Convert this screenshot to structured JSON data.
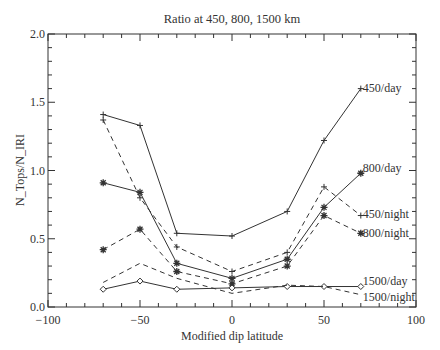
{
  "chart_data": {
    "type": "line",
    "title": "Ratio at 450, 800, 1500 km",
    "xlabel": "Modified dip latitude",
    "ylabel": "N_Tops/N_IRI",
    "xlim": [
      -100,
      100
    ],
    "ylim": [
      0.0,
      2.0
    ],
    "x_ticks": [
      -100,
      -50,
      0,
      50,
      100
    ],
    "x_tick_labels": [
      "−100",
      "−50",
      "0",
      "50",
      "100"
    ],
    "y_ticks": [
      0.0,
      0.5,
      1.0,
      1.5,
      2.0
    ],
    "y_tick_labels": [
      "0.0",
      "0.5",
      "1.0",
      "1.5",
      "2.0"
    ],
    "grid": false,
    "legend_position": "inline labels at right end of each series",
    "x": [
      -70,
      -50,
      -30,
      0,
      30,
      50,
      70
    ],
    "series": [
      {
        "name": "450/day",
        "style": "solid",
        "marker": "plus",
        "values": [
          1.41,
          1.33,
          0.54,
          0.52,
          0.7,
          1.22,
          1.6
        ]
      },
      {
        "name": "450/night",
        "style": "dashed",
        "marker": "plus",
        "values": [
          1.37,
          0.8,
          0.44,
          0.26,
          0.4,
          0.88,
          0.67
        ]
      },
      {
        "name": "800/day",
        "style": "solid",
        "marker": "asterisk",
        "values": [
          0.91,
          0.84,
          0.32,
          0.21,
          0.35,
          0.73,
          0.98
        ]
      },
      {
        "name": "800/night",
        "style": "dashed",
        "marker": "asterisk",
        "values": [
          0.42,
          0.57,
          0.26,
          0.17,
          0.3,
          0.67,
          0.54
        ]
      },
      {
        "name": "1500/day",
        "style": "solid",
        "marker": "diamond",
        "values": [
          0.13,
          0.19,
          0.13,
          0.14,
          0.15,
          0.15,
          0.15
        ]
      },
      {
        "name": "1500/night",
        "style": "dashed",
        "marker": "none",
        "values": [
          0.18,
          0.32,
          0.21,
          0.1,
          0.16,
          0.15,
          0.09
        ]
      }
    ]
  }
}
